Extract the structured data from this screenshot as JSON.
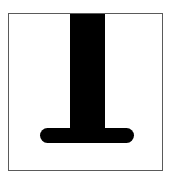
{
  "figure": {
    "title": "",
    "alt_label": "inverted-tee-glyph",
    "background_color": "#ffffff",
    "frame": {
      "border_color": "#5a5a5a",
      "fill_color": "#ffffff",
      "x": 8,
      "y": 13,
      "width": 155,
      "height": 158,
      "border_width": 1.5
    },
    "glyph": {
      "shape_name": "inverted-tee",
      "color": "#000000",
      "stem": {
        "x": 70,
        "y": 14,
        "width": 35,
        "height": 122
      },
      "crossbar": {
        "x": 40,
        "y": 128,
        "width": 94,
        "height": 15,
        "cap_radius": 7.5,
        "cap_style": "round"
      }
    }
  }
}
